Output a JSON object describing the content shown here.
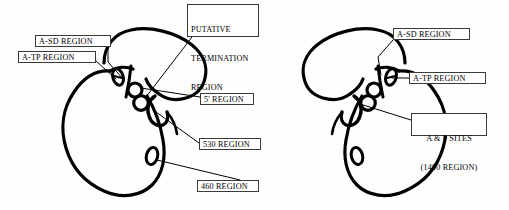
{
  "figure": {
    "type": "secondary-structure-diagram",
    "background_color": "#fefefe",
    "stroke_color": "#000000",
    "label_border_color": "#3a3a3a"
  },
  "labels": {
    "left_a_sd": {
      "text": "A-SD REGION",
      "x": 35,
      "y": 35,
      "w": 76,
      "h": 12
    },
    "left_a_tp": {
      "text": "A-TP REGION",
      "x": 18,
      "y": 51,
      "w": 78,
      "h": 12
    },
    "putative_termination": {
      "line1": "PUTATIVE",
      "line2": "TERMINATION",
      "line3": "REGION",
      "x": 187,
      "y": 4,
      "w": 72,
      "h": 33
    },
    "five_prime": {
      "text": "5' REGION",
      "x": 200,
      "y": 93,
      "w": 54,
      "h": 12
    },
    "region_530": {
      "text": "530 REGION",
      "x": 199,
      "y": 138,
      "w": 62,
      "h": 12
    },
    "region_460": {
      "text": "460 REGION",
      "x": 197,
      "y": 180,
      "w": 62,
      "h": 12
    },
    "right_a_sd": {
      "text": "A-SD REGION",
      "x": 393,
      "y": 28,
      "w": 77,
      "h": 12
    },
    "right_a_tp": {
      "text": "A-TP REGION",
      "x": 409,
      "y": 72,
      "w": 77,
      "h": 12
    },
    "ap_sites": {
      "line1": "A & P SITES",
      "line2": "(1400 REGION)",
      "x": 411,
      "y": 113,
      "w": 76,
      "h": 23
    }
  },
  "structures": {
    "left": {
      "name": "left-structure",
      "orientation": "normal"
    },
    "right": {
      "name": "right-structure",
      "orientation": "mirrored"
    }
  }
}
